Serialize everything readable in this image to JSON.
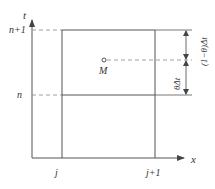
{
  "diagram": {
    "axes": {
      "vertical_label": "t",
      "horizontal_label": "x"
    },
    "time_levels": {
      "upper": "n+1",
      "lower": "n"
    },
    "space_nodes": {
      "left": "j",
      "right": "j+1"
    },
    "point": {
      "label": "M"
    },
    "dimensions": {
      "upper_segment": "(1−θ)Δt",
      "lower_segment": "θΔt"
    },
    "colors": {
      "line": "#555555",
      "dashed": "#888888",
      "text": "#333333"
    }
  }
}
